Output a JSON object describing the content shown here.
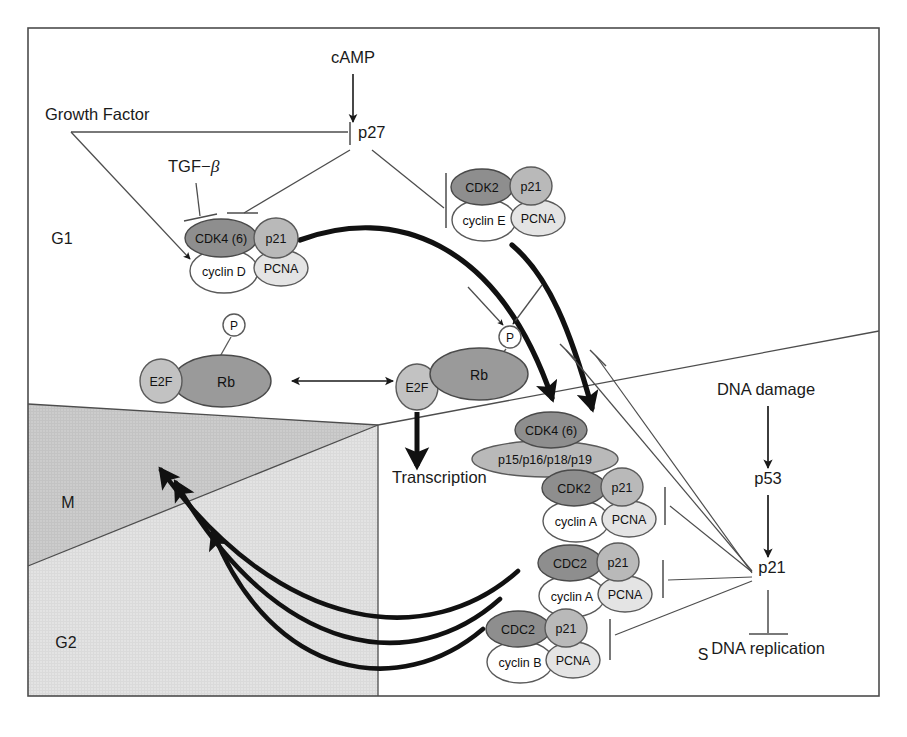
{
  "figure": {
    "frame": {
      "stroke": "#4d4d4d",
      "fill": "#ffffff"
    }
  },
  "colors": {
    "cdk_fill": "#8e8e8e",
    "cdk_stroke": "#4a4a4a",
    "cki_fill": "#b9b9b9",
    "cki_stroke": "#5a5a5a",
    "pcna_fill": "#e4e4e4",
    "pcna_stroke": "#5a5a5a",
    "cyclin_fill": "#ffffff",
    "cyclin_stroke": "#5a5a5a",
    "rb_fill": "#9a9a9a",
    "e2f_fill": "#c2c2c2",
    "phospho_fill": "#ffffff",
    "phase_m_fill": "#cccccc",
    "phase_g2_fill": "#e2e2e2",
    "phase_g1_fill": "#ffffff",
    "phase_s_fill": "#ffffff",
    "line": "#4d4d4d",
    "bold_line": "#1a1a1a",
    "text": "#1a1a1a"
  },
  "phases": [
    {
      "id": "g1",
      "label": "G1",
      "x": 62,
      "y": 244
    },
    {
      "id": "m",
      "label": "M",
      "x": 68,
      "y": 508
    },
    {
      "id": "g2",
      "label": "G2",
      "x": 66,
      "y": 648
    },
    {
      "id": "s",
      "label": "S",
      "x": 703,
      "y": 660
    }
  ],
  "signals": [
    {
      "id": "camp",
      "label": "cAMP",
      "x": 353,
      "y": 63,
      "anchor": "middle"
    },
    {
      "id": "growth-factor",
      "label": "Growth Factor",
      "x": 45,
      "y": 120,
      "anchor": "start"
    },
    {
      "id": "tgf-beta",
      "label": "TGF−",
      "italic": "β",
      "x": 168,
      "y": 172,
      "anchor": "start"
    },
    {
      "id": "p27",
      "label": "p27",
      "x": 358,
      "y": 138,
      "anchor": "start"
    },
    {
      "id": "transcription",
      "label": "Transcription",
      "x": 392,
      "y": 483,
      "anchor": "start"
    },
    {
      "id": "dna-damage",
      "label": "DNA damage",
      "x": 766,
      "y": 395,
      "anchor": "middle"
    },
    {
      "id": "p53",
      "label": "p53",
      "x": 768,
      "y": 484,
      "anchor": "middle"
    },
    {
      "id": "p21-hub",
      "label": "p21",
      "x": 772,
      "y": 573,
      "anchor": "middle"
    },
    {
      "id": "dna-replication",
      "label": "DNA replication",
      "x": 768,
      "y": 654,
      "anchor": "middle"
    }
  ],
  "phospho_marks": [
    {
      "id": "p-free-rb",
      "label": "P",
      "cx": 234,
      "cy": 325
    },
    {
      "id": "p-bound-rb",
      "label": "P",
      "cx": 510,
      "cy": 337
    }
  ],
  "rb_complexes": [
    {
      "id": "e2f-rb-hypo",
      "e2f": {
        "label": "E2F",
        "cx": 161,
        "cy": 381,
        "rx": 21,
        "ry": 22
      },
      "rb": {
        "label": "Rb",
        "cx": 222,
        "cy": 381,
        "rx": 49,
        "ry": 26
      }
    },
    {
      "id": "rb-phospho",
      "rb": {
        "label": "Rb",
        "cx": 479,
        "cy": 374,
        "rx": 49,
        "ry": 26
      }
    },
    {
      "id": "e2f-free",
      "e2f": {
        "label": "E2F",
        "cx": 417,
        "cy": 387,
        "rx": 21,
        "ry": 23
      }
    }
  ],
  "complexes": [
    {
      "id": "cdk4-cyclinD",
      "cdk": {
        "label": "CDK4 (6)",
        "cx": 221,
        "cy": 238,
        "rx": 36,
        "ry": 19,
        "size": 12.5
      },
      "cki": {
        "label": "p21",
        "cx": 276,
        "cy": 238,
        "rx": 22,
        "ry": 20,
        "size": 12.5
      },
      "cyclin": {
        "label": "cyclin D",
        "cx": 224,
        "cy": 271,
        "rx": 34,
        "ry": 22,
        "size": 12.5
      },
      "pcna": {
        "label": "PCNA",
        "cx": 281,
        "cy": 268,
        "rx": 27,
        "ry": 18,
        "size": 12.5
      }
    },
    {
      "id": "cdk2-cyclinE",
      "cdk": {
        "label": "CDK2",
        "cx": 482,
        "cy": 187,
        "rx": 31,
        "ry": 18,
        "size": 12.5
      },
      "cki": {
        "label": "p21",
        "cx": 531,
        "cy": 186,
        "rx": 21,
        "ry": 19,
        "size": 12.5
      },
      "cyclin": {
        "label": "cyclin E",
        "cx": 484,
        "cy": 220,
        "rx": 32,
        "ry": 21,
        "size": 12.5
      },
      "pcna": {
        "label": "PCNA",
        "cx": 538,
        "cy": 218,
        "rx": 27,
        "ry": 18,
        "size": 12.5
      }
    },
    {
      "id": "cdk4-ink4",
      "cdk": {
        "label": "CDK4 (6)",
        "cx": 551,
        "cy": 430,
        "rx": 36,
        "ry": 18,
        "size": 12.5
      },
      "ink4": {
        "label": "p15/p16/p18/p19",
        "cx": 545,
        "cy": 459,
        "rx": 73,
        "ry": 18,
        "size": 12.5
      }
    },
    {
      "id": "cdk2-cyclinA",
      "cdk": {
        "label": "CDK2",
        "cx": 574,
        "cy": 488,
        "rx": 32,
        "ry": 18,
        "size": 12.5
      },
      "cki": {
        "label": "p21",
        "cx": 622,
        "cy": 487,
        "rx": 21,
        "ry": 19,
        "size": 12.5
      },
      "cyclin": {
        "label": "cyclin A",
        "cx": 576,
        "cy": 521,
        "rx": 33,
        "ry": 21,
        "size": 12.5
      },
      "pcna": {
        "label": "PCNA",
        "cx": 629,
        "cy": 519,
        "rx": 27,
        "ry": 18,
        "size": 12.5
      }
    },
    {
      "id": "cdc2-cyclinA",
      "cdk": {
        "label": "CDC2",
        "cx": 570,
        "cy": 563,
        "rx": 32,
        "ry": 18,
        "size": 12.5
      },
      "cki": {
        "label": "p21",
        "cx": 618,
        "cy": 562,
        "rx": 21,
        "ry": 19,
        "size": 12.5
      },
      "cyclin": {
        "label": "cyclin A",
        "cx": 572,
        "cy": 596,
        "rx": 33,
        "ry": 21,
        "size": 12.5
      },
      "pcna": {
        "label": "PCNA",
        "cx": 625,
        "cy": 594,
        "rx": 27,
        "ry": 18,
        "size": 12.5
      }
    },
    {
      "id": "cdc2-cyclinB",
      "cdk": {
        "label": "CDC2",
        "cx": 518,
        "cy": 629,
        "rx": 32,
        "ry": 18,
        "size": 12.5
      },
      "cki": {
        "label": "p21",
        "cx": 566,
        "cy": 628,
        "rx": 21,
        "ry": 19,
        "size": 12.5
      },
      "cyclin": {
        "label": "cyclin B",
        "cx": 520,
        "cy": 662,
        "rx": 33,
        "ry": 21,
        "size": 12.5
      },
      "pcna": {
        "label": "PCNA",
        "cx": 573,
        "cy": 660,
        "rx": 27,
        "ry": 18,
        "size": 12.5
      }
    }
  ],
  "edges": [
    {
      "id": "camp-to-p27",
      "kind": "activate",
      "from": "cAMP",
      "to": "p27"
    },
    {
      "id": "gf-inhibits-p27",
      "kind": "inhibit",
      "from": "Growth Factor",
      "to": "p27"
    },
    {
      "id": "gf-activates-cdk4",
      "kind": "activate",
      "from": "Growth Factor",
      "to": "CDK4 (6) / cyclin D"
    },
    {
      "id": "tgfb-inhibits-cdk4",
      "kind": "inhibit",
      "from": "TGF-β",
      "to": "CDK4 (6) / cyclin D"
    },
    {
      "id": "p27-inhibits-cdk4",
      "kind": "inhibit",
      "from": "p27",
      "to": "CDK4 (6) / cyclin D"
    },
    {
      "id": "p27-inhibits-cdk2e",
      "kind": "inhibit",
      "from": "p27",
      "to": "CDK2 / cyclin E"
    },
    {
      "id": "cdk4d-phosphorylates-rb",
      "kind": "activate",
      "from": "CDK4 (6) / cyclin D",
      "to": "Rb-P"
    },
    {
      "id": "cdk2e-phosphorylates-rb",
      "kind": "activate",
      "from": "CDK2 / cyclin E",
      "to": "Rb-P"
    },
    {
      "id": "e2f-rb-equilibrium",
      "kind": "reversible",
      "from": "E2F·Rb",
      "to": "E2F + Rb-P"
    },
    {
      "id": "e2f-to-transcription",
      "kind": "activate",
      "from": "E2F",
      "to": "Transcription"
    },
    {
      "id": "dna-damage-to-p53",
      "kind": "activate",
      "from": "DNA damage",
      "to": "p53"
    },
    {
      "id": "p53-to-p21",
      "kind": "activate",
      "from": "p53",
      "to": "p21"
    },
    {
      "id": "p21-inhibits-replication",
      "kind": "inhibit",
      "from": "p21",
      "to": "DNA replication"
    },
    {
      "id": "p21-inhibits-cdk4-ink4",
      "kind": "inhibit",
      "from": "p21",
      "to": "CDK4 (6) / p15-p19"
    },
    {
      "id": "p21-inhibits-cdk2a",
      "kind": "inhibit",
      "from": "p21",
      "to": "CDK2 / cyclin A"
    },
    {
      "id": "p21-inhibits-cdc2a",
      "kind": "inhibit",
      "from": "p21",
      "to": "CDC2 / cyclin A"
    },
    {
      "id": "p21-inhibits-cdc2b",
      "kind": "inhibit",
      "from": "p21",
      "to": "CDC2 / cyclin B"
    },
    {
      "id": "cycle-g1-to-s",
      "kind": "cycle",
      "from": "G1",
      "to": "S"
    },
    {
      "id": "cycle-s-to-m",
      "kind": "cycle",
      "from": "S",
      "to": "M"
    }
  ]
}
